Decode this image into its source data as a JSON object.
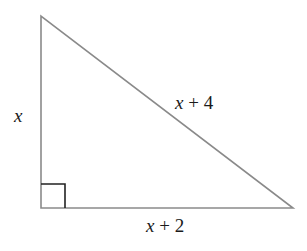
{
  "diagram": {
    "type": "right-triangle",
    "vertices": {
      "top": [
        41,
        16
      ],
      "bottom_left": [
        41,
        208
      ],
      "bottom_right": [
        293,
        208
      ]
    },
    "right_angle_marker": {
      "corner": "bottom_left",
      "size": 24
    },
    "colors": {
      "stroke": "#8a8a8a",
      "marker": "#222222",
      "text": "#1a1a1a",
      "background": "#ffffff"
    },
    "labels": {
      "left_side": {
        "var": "x",
        "rest": ""
      },
      "hypotenuse": {
        "var": "x",
        "rest": " + 4"
      },
      "base": {
        "var": "x",
        "rest": " + 2"
      }
    }
  }
}
